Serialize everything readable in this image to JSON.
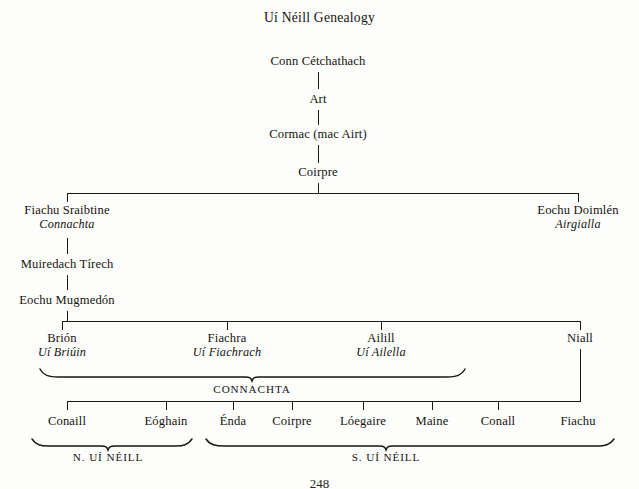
{
  "document": {
    "title": "Uí Néill Genealogy",
    "folio": "248"
  },
  "tree": {
    "root_chain": [
      {
        "name": "Conn Cétchathach",
        "x": 318,
        "y": 54
      },
      {
        "name": "Art",
        "x": 318,
        "y": 92
      },
      {
        "name": "Cormac (mac Airt)",
        "x": 318,
        "y": 127
      },
      {
        "name": "Coirpre",
        "x": 318,
        "y": 165
      }
    ],
    "generation_coirpre_children": [
      {
        "name": "Fiachu Sraibtine",
        "sept": "Connachta",
        "x": 67,
        "y": 203
      },
      {
        "name": "Eochu Doimlén",
        "sept": "Airgialla",
        "x": 578,
        "y": 203
      }
    ],
    "connachta_line": [
      {
        "name": "Muiredach Tírech",
        "sept": "",
        "x": 67,
        "y": 257
      },
      {
        "name": "Eochu Mugmedón",
        "sept": "",
        "x": 67,
        "y": 293
      }
    ],
    "generation_mugmedon_children": [
      {
        "name": "Brión",
        "sept": "Uí Briúin",
        "x": 62,
        "y": 331
      },
      {
        "name": "Fiachra",
        "sept": "Uí Fiachrach",
        "x": 227,
        "y": 331
      },
      {
        "name": "Ailill",
        "sept": "Uí Ailella",
        "x": 381,
        "y": 331
      },
      {
        "name": "Niall",
        "sept": "",
        "x": 580,
        "y": 331
      }
    ],
    "generation_niall_children": [
      {
        "name": "Conaill",
        "x": 67,
        "y": 421
      },
      {
        "name": "Eóghain",
        "x": 166,
        "y": 421
      },
      {
        "name": "Énda",
        "x": 233,
        "y": 421
      },
      {
        "name": "Coirpre",
        "x": 292,
        "y": 421
      },
      {
        "name": "Lóegaire",
        "x": 363,
        "y": 421
      },
      {
        "name": "Maine",
        "x": 432,
        "y": 421
      },
      {
        "name": "Conall",
        "x": 498,
        "y": 421
      },
      {
        "name": "Fiachu",
        "x": 578,
        "y": 421
      }
    ],
    "group_labels": [
      {
        "label": "CONNACHTA",
        "x": 252,
        "y": 383,
        "brace_left": 40,
        "brace_right": 465,
        "brace_y": 374
      },
      {
        "label": "N. UÍ NÉILL",
        "x": 108,
        "y": 455,
        "brace_left": 32,
        "brace_right": 192,
        "brace_y": 443
      },
      {
        "label": "S. UÍ NÉILL",
        "x": 386,
        "y": 455,
        "brace_left": 206,
        "brace_right": 614,
        "brace_y": 443
      }
    ]
  },
  "colors": {
    "ink": "#16130f",
    "line": "#1d1a17",
    "paper": "#fdfdfc"
  }
}
